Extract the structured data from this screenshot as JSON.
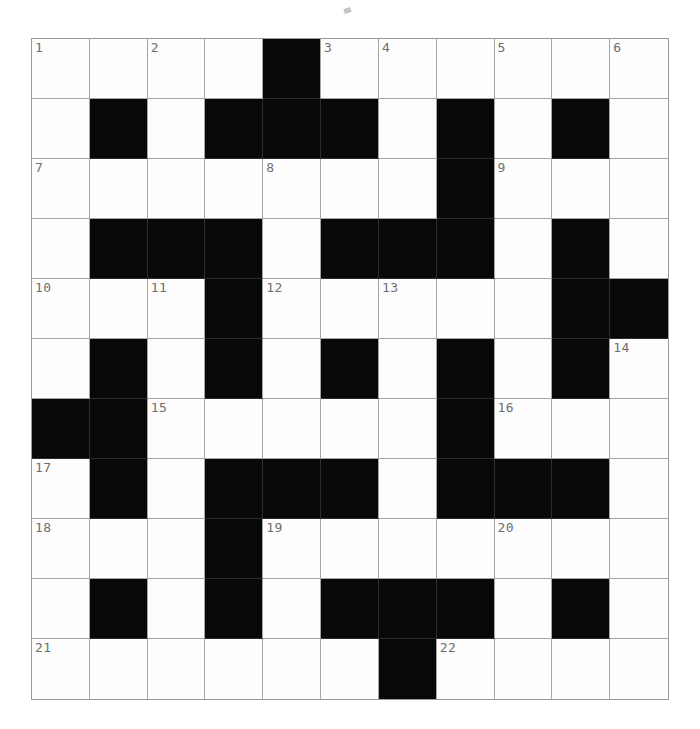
{
  "puzzle": {
    "title": "Crossword Grid",
    "type": "crossword",
    "rows": 11,
    "cols": 11,
    "colors": {
      "block": "#080808",
      "cell": "#fdfdfd",
      "gridline": "#a5a5a5",
      "number": "#6f6f6f",
      "page_background": "#ffffff"
    },
    "legend": {
      "block_label": "blocked-square",
      "open_label": "open-square"
    },
    "grid": [
      [
        "W",
        "W",
        "W",
        "W",
        "B",
        "W",
        "W",
        "W",
        "W",
        "W",
        "W"
      ],
      [
        "W",
        "B",
        "W",
        "B",
        "B",
        "B",
        "W",
        "B",
        "W",
        "B",
        "W"
      ],
      [
        "W",
        "W",
        "W",
        "W",
        "W",
        "W",
        "W",
        "B",
        "W",
        "W",
        "W"
      ],
      [
        "W",
        "B",
        "B",
        "B",
        "W",
        "B",
        "B",
        "B",
        "W",
        "B",
        "W"
      ],
      [
        "W",
        "W",
        "W",
        "B",
        "W",
        "W",
        "W",
        "W",
        "W",
        "B",
        "B"
      ],
      [
        "W",
        "B",
        "W",
        "B",
        "W",
        "B",
        "W",
        "B",
        "W",
        "B",
        "W"
      ],
      [
        "B",
        "B",
        "W",
        "W",
        "W",
        "W",
        "W",
        "B",
        "W",
        "W",
        "W"
      ],
      [
        "W",
        "B",
        "W",
        "B",
        "B",
        "B",
        "W",
        "B",
        "B",
        "B",
        "W"
      ],
      [
        "W",
        "W",
        "W",
        "B",
        "W",
        "W",
        "W",
        "W",
        "W",
        "W",
        "W"
      ],
      [
        "W",
        "B",
        "W",
        "B",
        "W",
        "B",
        "B",
        "B",
        "W",
        "B",
        "W"
      ],
      [
        "W",
        "W",
        "W",
        "W",
        "W",
        "W",
        "B",
        "W",
        "W",
        "W",
        "W"
      ]
    ],
    "numbers": [
      {
        "row": 0,
        "col": 0,
        "label": "1"
      },
      {
        "row": 0,
        "col": 2,
        "label": "2"
      },
      {
        "row": 0,
        "col": 5,
        "label": "3"
      },
      {
        "row": 0,
        "col": 6,
        "label": "4"
      },
      {
        "row": 0,
        "col": 8,
        "label": "5"
      },
      {
        "row": 0,
        "col": 10,
        "label": "6"
      },
      {
        "row": 2,
        "col": 0,
        "label": "7"
      },
      {
        "row": 2,
        "col": 4,
        "label": "8"
      },
      {
        "row": 2,
        "col": 8,
        "label": "9"
      },
      {
        "row": 4,
        "col": 0,
        "label": "10"
      },
      {
        "row": 4,
        "col": 2,
        "label": "11"
      },
      {
        "row": 4,
        "col": 4,
        "label": "12"
      },
      {
        "row": 4,
        "col": 6,
        "label": "13"
      },
      {
        "row": 5,
        "col": 10,
        "label": "14"
      },
      {
        "row": 6,
        "col": 2,
        "label": "15"
      },
      {
        "row": 6,
        "col": 8,
        "label": "16"
      },
      {
        "row": 7,
        "col": 0,
        "label": "17"
      },
      {
        "row": 8,
        "col": 0,
        "label": "18"
      },
      {
        "row": 8,
        "col": 4,
        "label": "19"
      },
      {
        "row": 8,
        "col": 8,
        "label": "20"
      },
      {
        "row": 10,
        "col": 0,
        "label": "21"
      },
      {
        "row": 10,
        "col": 7,
        "label": "22"
      }
    ]
  }
}
